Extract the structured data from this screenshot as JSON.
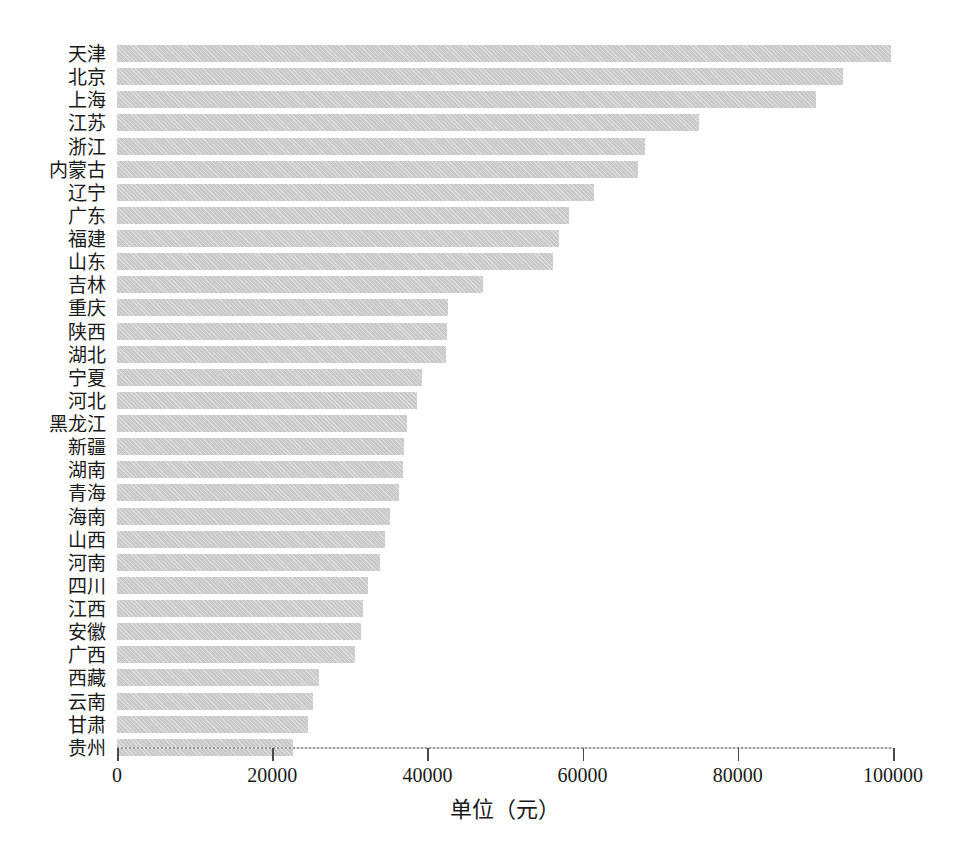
{
  "chart_data": {
    "type": "bar",
    "orientation": "horizontal",
    "title": "",
    "subtitle": "",
    "xlabel": "单位（元）",
    "ylabel": "",
    "xlim": [
      0,
      100000
    ],
    "xticks": [
      0,
      20000,
      40000,
      60000,
      80000,
      100000
    ],
    "xtick_labels": [
      "0",
      "20000",
      "40000",
      "60000",
      "80000",
      "100000"
    ],
    "grid": false,
    "legend": null,
    "bar_color": "#c9c9c9",
    "categories": [
      "天津",
      "北京",
      "上海",
      "江苏",
      "浙江",
      "内蒙古",
      "辽宁",
      "广东",
      "福建",
      "山东",
      "吉林",
      "重庆",
      "陕西",
      "湖北",
      "宁夏",
      "河北",
      "黑龙江",
      "新疆",
      "湖南",
      "青海",
      "海南",
      "山西",
      "河南",
      "四川",
      "江西",
      "安徽",
      "广西",
      "西藏",
      "云南",
      "甘肃",
      "贵州"
    ],
    "values": [
      99800,
      93600,
      90100,
      75000,
      68000,
      67200,
      61500,
      58200,
      57000,
      56200,
      47200,
      42700,
      42500,
      42400,
      39300,
      38600,
      37400,
      37000,
      36800,
      36300,
      35200,
      34500,
      33900,
      32400,
      31700,
      31400,
      30700,
      26000,
      25300,
      24600,
      22700
    ],
    "series": [
      {
        "name": "人均值",
        "values": [
          99800,
          93600,
          90100,
          75000,
          68000,
          67200,
          61500,
          58200,
          57000,
          56200,
          47200,
          42700,
          42500,
          42400,
          39300,
          38600,
          37400,
          37000,
          36800,
          36300,
          35200,
          34500,
          33900,
          32400,
          31700,
          31400,
          30700,
          26000,
          25300,
          24600,
          22700
        ]
      }
    ]
  }
}
